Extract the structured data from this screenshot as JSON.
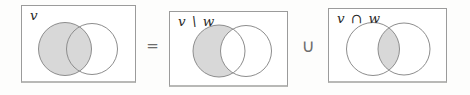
{
  "identity_equation": "v = (v \\ w) ∪ (v ∩ w)",
  "diagrams": [
    {
      "label": "v",
      "shaded_region": "left-circle",
      "description": "whole left circle shaded"
    },
    {
      "label": "v \\ w",
      "shaded_region": "left-minus-right",
      "description": "left crescent shaded, intersection white"
    },
    {
      "label": "v ∩ w",
      "shaded_region": "intersection",
      "description": "only lens-shaped overlap shaded"
    }
  ],
  "operators": [
    {
      "symbol": "="
    },
    {
      "symbol": "∪"
    }
  ],
  "colors": {
    "shade_fill": "#d8d8d8",
    "circle_stroke": "#8d8d8d",
    "box_border": "#9b9b9b",
    "box_fill": "#ffffff",
    "label_color": "#2a2a2a",
    "operator_color": "#6d6d6d",
    "background": "#fdfdfc"
  }
}
